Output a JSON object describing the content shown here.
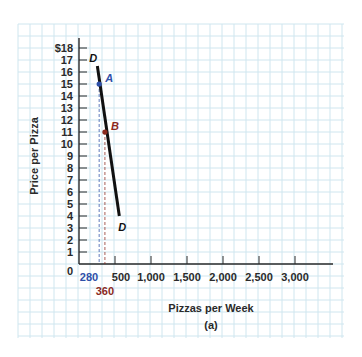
{
  "chart_data": {
    "type": "line",
    "title": "",
    "caption": "(a)",
    "xlabel": "Pizzas per Week",
    "ylabel": "Price per Pizza",
    "xlim": [
      0,
      3500
    ],
    "ylim": [
      0,
      18
    ],
    "grid": true,
    "x_ticks": [
      500,
      1000,
      1500,
      2000,
      2500,
      3000
    ],
    "x_tick_labels": [
      "500",
      "1,000",
      "1,500",
      "2,000",
      "2,500",
      "3,000"
    ],
    "y_ticks": [
      1,
      2,
      3,
      4,
      5,
      6,
      7,
      8,
      9,
      10,
      11,
      12,
      13,
      14,
      15,
      16,
      17,
      18
    ],
    "y_tick_labels": [
      "1",
      "2",
      "3",
      "4",
      "5",
      "6",
      "7",
      "8",
      "9",
      "10",
      "11",
      "12",
      "13",
      "14",
      "15",
      "16",
      "17",
      "$18"
    ],
    "origin_label": "0",
    "series": [
      {
        "name": "D",
        "description": "Demand curve",
        "color": "#111111",
        "points": [
          {
            "x": 255,
            "y": 16.5
          },
          {
            "x": 560,
            "y": 4
          }
        ],
        "labels": [
          {
            "text": "D",
            "at": "top"
          },
          {
            "text": "D",
            "at": "bottom"
          }
        ]
      }
    ],
    "points": [
      {
        "label": "A",
        "x": 280,
        "y": 15,
        "color": "#2e4fa8",
        "x_marker_label": "280"
      },
      {
        "label": "B",
        "x": 360,
        "y": 11,
        "color": "#8b2a1e",
        "x_marker_label": "360"
      }
    ],
    "colors": {
      "grid": "#cfe6ef",
      "axis": "#2a2a2a",
      "point_a": "#2e4fa8",
      "point_b": "#8b2a1e"
    }
  }
}
